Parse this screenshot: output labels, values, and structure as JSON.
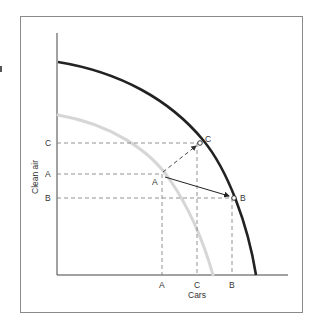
{
  "diagram": {
    "x_axis_label": "Cars",
    "y_axis_label": "Clean air",
    "x_ticks": [
      {
        "label": "A",
        "x": 162
      },
      {
        "label": "C",
        "x": 197
      },
      {
        "label": "B",
        "x": 232
      }
    ],
    "y_ticks": [
      {
        "label": "C",
        "y": 143
      },
      {
        "label": "A",
        "y": 174
      },
      {
        "label": "B",
        "y": 198
      }
    ],
    "curves": [
      {
        "name": "outer-frontier",
        "color": "#222222",
        "description": "Current production possibilities frontier"
      },
      {
        "name": "inner-frontier",
        "color": "#d4d4d4",
        "description": "Original production possibilities frontier"
      }
    ],
    "points": [
      {
        "label": "A",
        "x": 161,
        "y": 174,
        "on": "inner-frontier"
      },
      {
        "label": "C",
        "x": 200,
        "y": 143,
        "on": "outer-frontier"
      },
      {
        "label": "B",
        "x": 234,
        "y": 198,
        "on": "outer-frontier"
      }
    ],
    "arrows": [
      {
        "from": "A",
        "to": "C",
        "style": "dashed"
      },
      {
        "from": "A",
        "to": "B",
        "style": "solid"
      }
    ]
  }
}
